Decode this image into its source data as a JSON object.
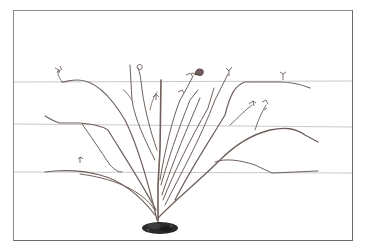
{
  "illustration": {
    "subject": "Trained cane plant on three horizontal support wires",
    "wires": [
      {
        "y": 82
      },
      {
        "y": 125
      },
      {
        "y": 172
      }
    ],
    "colors": {
      "background": "#ffffff",
      "frame": "#8a8a8a",
      "wire": "#c9c9c9",
      "cane": "#6e5f5a",
      "soil": "#2a2a2a"
    }
  }
}
